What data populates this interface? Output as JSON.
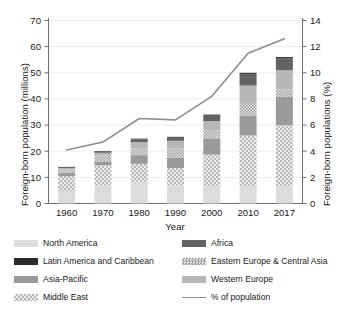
{
  "chart_data": {
    "type": "bar",
    "subtype": "stacked-bar-with-line",
    "title": "",
    "xlabel": "Year",
    "ylabel": "Foreign-born population (millions)",
    "y2label": "Foreign-born populations (%)",
    "categories": [
      "1960",
      "1970",
      "1980",
      "1990",
      "2000",
      "2010",
      "2017"
    ],
    "ylim": [
      0,
      70
    ],
    "yticks": [
      0,
      10,
      20,
      30,
      40,
      50,
      60,
      70
    ],
    "y2lim": [
      0,
      14
    ],
    "y2ticks": [
      0,
      2,
      4,
      6,
      8,
      10,
      12,
      14
    ],
    "grid": true,
    "legend_position": "bottom",
    "series": [
      {
        "name": "North America",
        "key": "north_america",
        "swatch": "solid-light-gray",
        "color": "#dcdcdc",
        "values": [
          4.8,
          7.0,
          8.0,
          7.0,
          6.5,
          6.5,
          6.5
        ]
      },
      {
        "name": "Middle East",
        "key": "middle_east",
        "swatch": "hatch-light-gray",
        "color": "#d0d0d0",
        "values": [
          5.6,
          7.6,
          7.2,
          6.6,
          12.2,
          19.5,
          23.5
        ]
      },
      {
        "name": "Asia-Pacific",
        "key": "asia_pacific",
        "swatch": "solid-medium-gray",
        "color": "#9a9a9a",
        "values": [
          1.4,
          1.3,
          3.3,
          4.0,
          6.2,
          7.5,
          10.8
        ]
      },
      {
        "name": "Eastern Europe & Central Asia",
        "key": "eastern_europe_central_asia",
        "swatch": "hatch-mid-gray",
        "color": "#c3c3c3",
        "values": [
          1.3,
          2.6,
          2.6,
          3.4,
          3.1,
          4.6,
          2.9
        ]
      },
      {
        "name": "Western Europe",
        "key": "western_europe",
        "swatch": "solid-lighter-gray",
        "color": "#b7b7b7",
        "values": [
          0.4,
          0.9,
          2.4,
          3.0,
          3.5,
          7.0,
          7.3
        ]
      },
      {
        "name": "Africa",
        "key": "africa",
        "swatch": "solid-dark-gray",
        "color": "#636363",
        "values": [
          0.3,
          0.4,
          1.0,
          1.2,
          2.1,
          4.5,
          4.6
        ]
      },
      {
        "name": "Latin America and Caribbean",
        "key": "latin_america_caribbean",
        "swatch": "solid-near-black",
        "color": "#2b2b2b",
        "values": [
          0.2,
          0.2,
          0.3,
          0.3,
          0.4,
          0.4,
          0.4
        ]
      }
    ],
    "line_series": {
      "name": "% of population",
      "key": "pct_of_population",
      "axis": "right",
      "color": "#8d8d8d",
      "values": [
        4.1,
        4.7,
        6.5,
        6.4,
        8.2,
        11.5,
        12.6
      ]
    }
  },
  "legend": {
    "left_column": [
      {
        "label": "North America",
        "key": "north_america"
      },
      {
        "label": "Latin America and Caribbean",
        "key": "latin_america_caribbean"
      },
      {
        "label": "Asia-Pacific",
        "key": "asia_pacific"
      },
      {
        "label": "Middle East",
        "key": "middle_east"
      }
    ],
    "right_column": [
      {
        "label": "Africa",
        "key": "africa"
      },
      {
        "label": "Eastern Europe & Central Asia",
        "key": "eastern_europe_central_asia"
      },
      {
        "label": "Western Europe",
        "key": "western_europe"
      },
      {
        "label": "% of population",
        "key": "pct_of_population"
      }
    ]
  }
}
